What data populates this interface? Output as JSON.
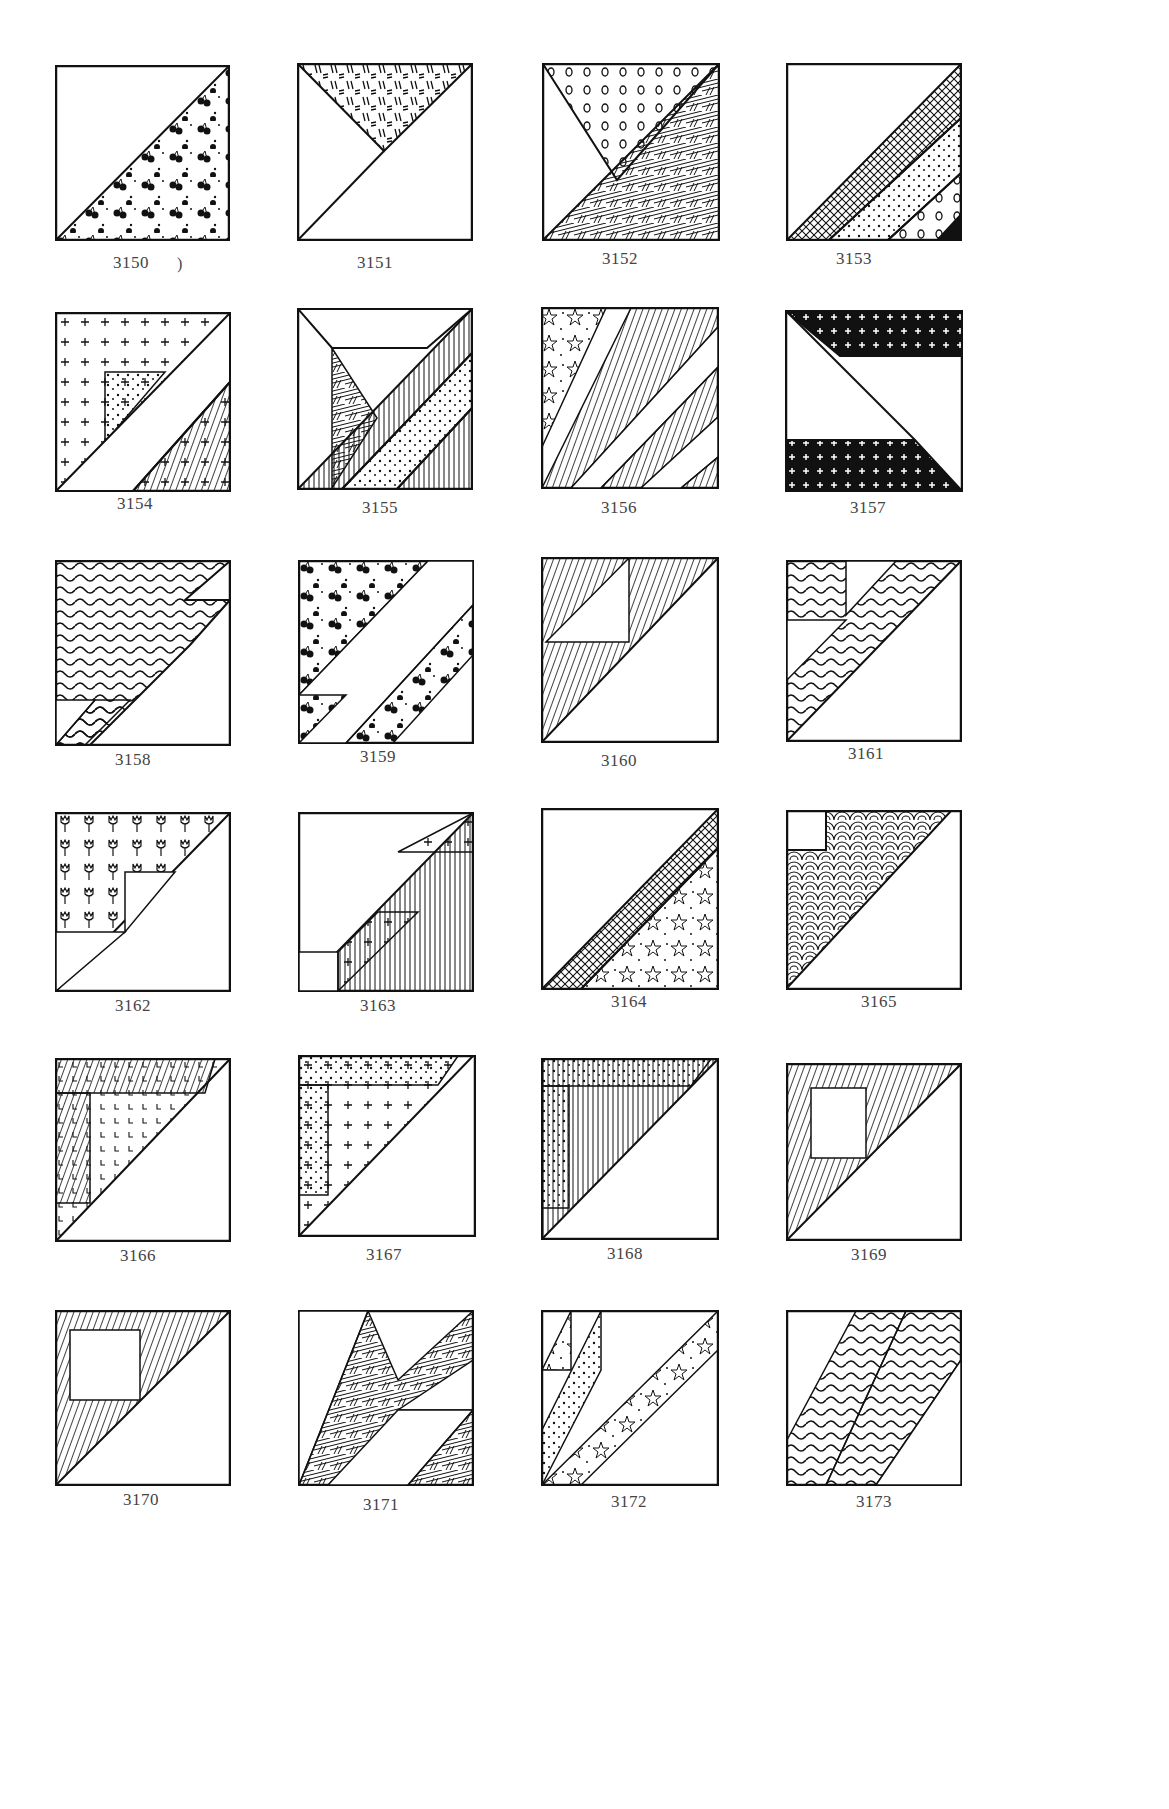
{
  "page": {
    "stray_mark": ")",
    "blocks": [
      {
        "id": "3150",
        "label": "3150"
      },
      {
        "id": "3151",
        "label": "3151"
      },
      {
        "id": "3152",
        "label": "3152"
      },
      {
        "id": "3153",
        "label": "3153"
      },
      {
        "id": "3154",
        "label": "3154"
      },
      {
        "id": "3155",
        "label": "3155"
      },
      {
        "id": "3156",
        "label": "3156"
      },
      {
        "id": "3157",
        "label": "3157"
      },
      {
        "id": "3158",
        "label": "3158"
      },
      {
        "id": "3159",
        "label": "3159"
      },
      {
        "id": "3160",
        "label": "3160"
      },
      {
        "id": "3161",
        "label": "3161"
      },
      {
        "id": "3162",
        "label": "3162"
      },
      {
        "id": "3163",
        "label": "3163"
      },
      {
        "id": "3164",
        "label": "3164"
      },
      {
        "id": "3165",
        "label": "3165"
      },
      {
        "id": "3166",
        "label": "3166"
      },
      {
        "id": "3167",
        "label": "3167"
      },
      {
        "id": "3168",
        "label": "3168"
      },
      {
        "id": "3169",
        "label": "3169"
      },
      {
        "id": "3170",
        "label": "3170"
      },
      {
        "id": "3171",
        "label": "3171"
      },
      {
        "id": "3172",
        "label": "3172"
      },
      {
        "id": "3173",
        "label": "3173"
      }
    ]
  }
}
